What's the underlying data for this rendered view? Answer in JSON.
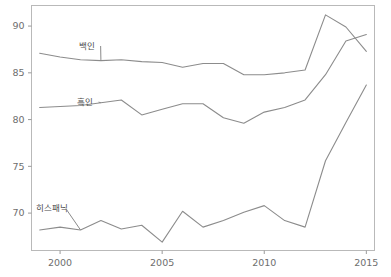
{
  "chart_data": {
    "type": "line",
    "title": "",
    "subtitle": "",
    "xlabel": "",
    "ylabel": "",
    "xlim": [
      1998.6,
      2015.4
    ],
    "ylim": [
      66.0,
      92.2
    ],
    "grid": false,
    "legend_position": "inline-labels",
    "x": [
      1999,
      2000,
      2001,
      2002,
      2003,
      2004,
      2005,
      2006,
      2007,
      2008,
      2009,
      2010,
      2011,
      2012,
      2013,
      2014,
      2015
    ],
    "xticks": [
      2000,
      2005,
      2010,
      2015
    ],
    "xtick_labels": [
      "2000",
      "2005",
      "2010",
      "2015"
    ],
    "yticks": [
      70,
      75,
      80,
      85,
      90
    ],
    "ytick_labels": [
      "70",
      "75",
      "80",
      "85",
      "90"
    ],
    "series": [
      {
        "name": "백인",
        "label": "백인",
        "color": "#8c8c8c",
        "values": [
          87.1,
          86.7,
          86.4,
          86.3,
          86.4,
          86.2,
          86.1,
          85.6,
          86.0,
          86.0,
          84.8,
          84.8,
          85.0,
          85.3,
          91.2,
          89.9,
          87.3
        ],
        "label_x": 2001.3,
        "label_y": 87.6
      },
      {
        "name": "흑인",
        "label": "흑인",
        "color": "#8c8c8c",
        "values": [
          81.3,
          81.4,
          81.5,
          81.8,
          82.1,
          80.5,
          81.1,
          81.7,
          81.7,
          80.2,
          79.6,
          80.8,
          81.3,
          82.1,
          84.8,
          88.4,
          89.1
        ],
        "label_x": 2001.2,
        "label_y": 81.6
      },
      {
        "name": "히스패닉",
        "label": "히스패닉",
        "color": "#8c8c8c",
        "values": [
          68.2,
          68.5,
          68.2,
          69.2,
          68.3,
          68.7,
          66.9,
          70.2,
          68.5,
          69.2,
          70.1,
          70.8,
          69.2,
          68.5,
          75.6,
          79.7,
          83.7
        ],
        "label_x": 1999.6,
        "label_y": 70.2
      }
    ]
  },
  "axes": {
    "frame_color": "#b9b9b9",
    "tick_color": "#9a9a9a",
    "label_color": "#6e6e6e"
  },
  "background": {
    "page_color": "#ffffff",
    "plot_color": "#ffffff"
  }
}
